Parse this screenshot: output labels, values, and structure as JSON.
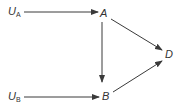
{
  "diagram": {
    "type": "directed-graph",
    "colors": {
      "stroke": "#3a3a3a",
      "text": "#333333",
      "background": "#ffffff"
    },
    "nodes": {
      "ua": {
        "main": "U",
        "sub": "A"
      },
      "ub": {
        "main": "U",
        "sub": "B"
      },
      "a": {
        "label": "A"
      },
      "b": {
        "label": "B"
      },
      "d": {
        "label": "D"
      }
    },
    "edges": [
      {
        "from": "U_A",
        "to": "A"
      },
      {
        "from": "U_B",
        "to": "B"
      },
      {
        "from": "A",
        "to": "B"
      },
      {
        "from": "A",
        "to": "D"
      },
      {
        "from": "B",
        "to": "D"
      }
    ]
  }
}
